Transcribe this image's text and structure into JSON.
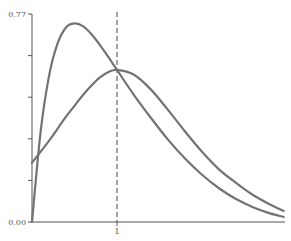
{
  "chart_data": {
    "type": "line",
    "title": "",
    "xlabel": "",
    "ylabel": "",
    "xlim": [
      0,
      3
    ],
    "ylim": [
      0,
      0.77
    ],
    "grid": false,
    "legend": null,
    "y_tick_labels": [
      "0.00",
      "0.77"
    ],
    "y_ticks": [
      0,
      0.154,
      0.308,
      0.462,
      0.616,
      0.77
    ],
    "x_tick_labels": [
      "1"
    ],
    "x_ticks": [
      1
    ],
    "reference_line": {
      "x": 1,
      "style": "dashed"
    },
    "series": [
      {
        "name": "curve-tall",
        "x": [
          0,
          0.1,
          0.2,
          0.3,
          0.4,
          0.5,
          0.6,
          0.7,
          0.8,
          0.9,
          1.0,
          1.2,
          1.4,
          1.6,
          1.8,
          2.0,
          2.2,
          2.4,
          2.6,
          2.8,
          2.96
        ],
        "values": [
          0.0,
          0.33,
          0.54,
          0.66,
          0.72,
          0.735,
          0.725,
          0.695,
          0.655,
          0.61,
          0.563,
          0.47,
          0.385,
          0.305,
          0.235,
          0.175,
          0.125,
          0.085,
          0.055,
          0.032,
          0.019
        ]
      },
      {
        "name": "curve-wide",
        "x": [
          0,
          0.1,
          0.2,
          0.3,
          0.4,
          0.5,
          0.6,
          0.7,
          0.8,
          0.9,
          1.0,
          1.2,
          1.4,
          1.6,
          1.8,
          2.0,
          2.2,
          2.4,
          2.6,
          2.8,
          2.96
        ],
        "values": [
          0.219,
          0.26,
          0.3,
          0.345,
          0.39,
          0.43,
          0.47,
          0.505,
          0.535,
          0.555,
          0.563,
          0.545,
          0.49,
          0.415,
          0.335,
          0.26,
          0.195,
          0.145,
          0.1,
          0.065,
          0.041
        ]
      }
    ]
  },
  "axes": {
    "y_min_label": "0.00",
    "y_max_label": "0.77",
    "x_label_1": "1"
  },
  "colors": {
    "line": "#737373",
    "axis": "#555555"
  }
}
